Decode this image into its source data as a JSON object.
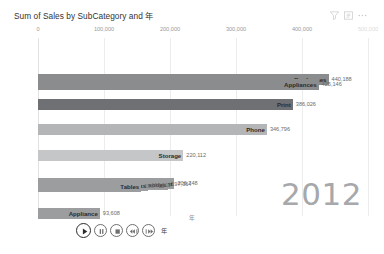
{
  "header": {
    "title": "Sum of Sales by SubCategory and 年",
    "icons": [
      {
        "name": "filter-icon",
        "label": "Filters"
      },
      {
        "name": "focus-mode-icon",
        "label": "Focus mode"
      },
      {
        "name": "more-options-icon",
        "label": "More options"
      }
    ]
  },
  "playback": {
    "field_label": "年",
    "buttons": [
      {
        "name": "play-button",
        "label": "Play"
      },
      {
        "name": "pause-button",
        "label": "Pause"
      },
      {
        "name": "stop-button",
        "label": "Stop"
      },
      {
        "name": "previous-button",
        "label": "Previous"
      },
      {
        "name": "next-button",
        "label": "Next"
      }
    ]
  },
  "year_watermark": "2012",
  "axis_title": "年",
  "chart_data": {
    "type": "bar",
    "orientation": "horizontal",
    "title": "Sum of Sales by SubCategory and 年",
    "xlabel": "",
    "ylabel": "年",
    "xlim": [
      0,
      500000
    ],
    "grid": true,
    "legend": false,
    "animation_frame": "2012",
    "xticks": [
      {
        "value": 0,
        "label": "0",
        "faint": false
      },
      {
        "value": 100000,
        "label": "100,000",
        "faint": false
      },
      {
        "value": 200000,
        "label": "200,000",
        "faint": false
      },
      {
        "value": 300000,
        "label": "300,000",
        "faint": false
      },
      {
        "value": 400000,
        "label": "400,000",
        "faint": false
      },
      {
        "value": 500000,
        "label": "500,000",
        "faint": true
      }
    ],
    "categories": [
      "Bookcases",
      "Appliances",
      "Print",
      "Phone",
      "Storage",
      "Equipment",
      "Accessories",
      "Desks",
      "Tables",
      "Appliance"
    ],
    "values": [
      440188,
      425146,
      386026,
      346796,
      220112,
      206748,
      197364,
      166911,
      156411,
      93608
    ],
    "bars": [
      {
        "category": "Bookcases",
        "value": 440188,
        "label": "440,188",
        "color": "#8a8c8e"
      },
      {
        "category": "Appliances",
        "value": 425146,
        "label": "425,146",
        "color": "#8a8c8e"
      },
      {
        "category": "Print",
        "value": 386026,
        "label": "386,026",
        "color": "#6e7073"
      },
      {
        "category": "Phone",
        "value": 346796,
        "label": "346,796",
        "color": "#b3b5b7"
      },
      {
        "category": "Storage",
        "value": 220112,
        "label": "220,112",
        "color": "#c4c6c8"
      },
      {
        "category": "Equipment",
        "value": 206748,
        "label": "206,748",
        "color": "#9b9d9f"
      },
      {
        "category": "Accessories",
        "value": 197364,
        "label": "197,364",
        "color": "#9b9d9f"
      },
      {
        "category": "Desks",
        "value": 166911,
        "label": "166,911",
        "color": "#9b9d9f"
      },
      {
        "category": "Tables",
        "value": 156411,
        "label": "156,411",
        "color": "#9b9d9f"
      },
      {
        "category": "Appliance",
        "value": 93608,
        "label": "93,608",
        "color": "#9b9d9f"
      }
    ]
  }
}
